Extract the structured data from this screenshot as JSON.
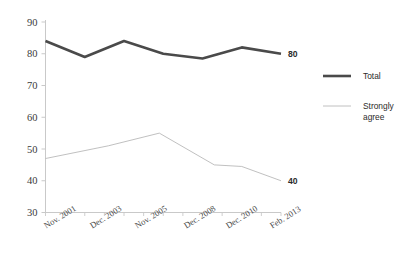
{
  "chart_data": {
    "type": "line",
    "title": "",
    "subtitle": "",
    "xlabel": "",
    "ylabel": "",
    "ylim": [
      30,
      90
    ],
    "ytick_step": 10,
    "yticks": [
      "30",
      "40",
      "50",
      "60",
      "70",
      "80",
      "90"
    ],
    "grid": false,
    "legend_position": "right",
    "categories": [
      "Nov. 2001",
      "Dec. 2003",
      "Nov. 2005",
      "Dec. 2008",
      "Dec. 2010",
      "Feb. 2013"
    ],
    "xtick_labels": [
      "Nov. 2001",
      "Dec. 2003",
      "Nov. 2005",
      "Dec. 2008",
      "Dec. 2010",
      "Feb. 2013"
    ],
    "series": [
      {
        "name": "Total",
        "color": "#4a4a4a",
        "stroke_width": 2.6,
        "x": [
          0,
          1,
          2,
          3,
          4,
          5,
          6
        ],
        "values": [
          84,
          79,
          84,
          80,
          78.5,
          82,
          80
        ],
        "end_label": "80"
      },
      {
        "name": "Strongly agree",
        "color": "#b9b9b9",
        "stroke_width": 0.9,
        "x": [
          0,
          1.6,
          2.9,
          4.3,
          5,
          6
        ],
        "values": [
          47,
          51,
          55,
          45,
          44.5,
          40
        ],
        "end_label": "40"
      }
    ],
    "annotations": [
      {
        "text": "80",
        "series": "Total",
        "position": "series-end"
      },
      {
        "text": "40",
        "series": "Strongly agree",
        "position": "series-end"
      }
    ]
  },
  "legend": {
    "entries": [
      {
        "label": "Total",
        "color": "#4a4a4a",
        "swatch": "thick-line-swatch"
      },
      {
        "label_line1": "Strongly",
        "label_line2": "agree",
        "label": "Strongly agree",
        "color": "#b9b9b9",
        "swatch": "thin-line-swatch"
      }
    ]
  },
  "axes": {
    "y_axis_color": "#c9c9c9",
    "x_axis_color": "#c9c9c9",
    "tick_color": "#c9c9c9"
  }
}
